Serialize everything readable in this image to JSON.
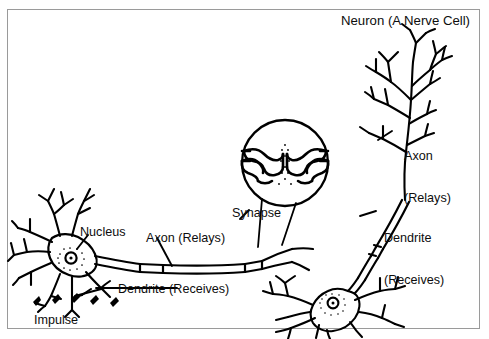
{
  "figure": {
    "title": "Neuron (A Nerve Cell)",
    "border_color": "#9a9a9a",
    "ink_color": "#000000",
    "background": "#ffffff"
  },
  "labels": {
    "title": "Neuron (A Nerve Cell)",
    "axon_right_line1": "Axon",
    "axon_right_line2": "(Relays)",
    "dendrite_right_line1": "Dendrite",
    "dendrite_right_line2": "(Receives)",
    "synapse": "Synapse",
    "nucleus": "Nucleus",
    "axon_left": "Axon (Relays)",
    "dendrite_left": "Dendrite (Receives)",
    "impulse": "Impulse"
  },
  "parts": [
    {
      "name": "neuron-right",
      "label": "Neuron (A Nerve Cell)"
    },
    {
      "name": "axon-right",
      "label": "Axon (Relays)"
    },
    {
      "name": "dendrite-right",
      "label": "Dendrite (Receives)"
    },
    {
      "name": "synapse-magnifier",
      "label": "Synapse"
    },
    {
      "name": "nucleus-left",
      "label": "Nucleus"
    },
    {
      "name": "axon-left",
      "label": "Axon (Relays)"
    },
    {
      "name": "dendrite-left",
      "label": "Dendrite (Receives)"
    },
    {
      "name": "impulse-arrows",
      "label": "Impulse"
    }
  ]
}
